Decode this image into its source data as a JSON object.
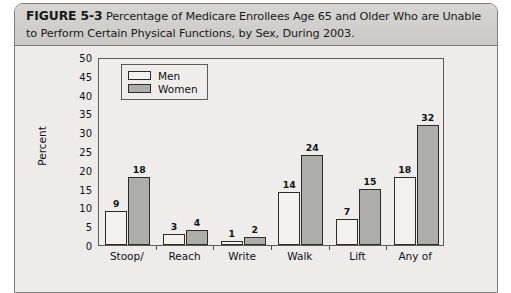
{
  "figure": {
    "number_label": "FIGURE 5-3",
    "caption": "Percentage of Medicare Enrollees Age 65 and Older Who are Unable to Perform Certain Physical Functions, by Sex, During 2003."
  },
  "colors": {
    "men_fill": "#f2f1ef",
    "women_fill": "#adadab",
    "bar_outline": "#2b2b2b",
    "plot_background": "#efedeb",
    "caption_background": "#d3d1ce"
  },
  "legend": {
    "position": "top-left-inside",
    "entries": [
      {
        "label": "Men",
        "swatch": "men"
      },
      {
        "label": "Women",
        "swatch": "women"
      }
    ]
  },
  "chart_data": {
    "type": "bar",
    "title": "Percentage of Medicare Enrollees Age 65 and Older Who are Unable to Perform Certain Physical Functions, by Sex, During 2003.",
    "xlabel": "",
    "ylabel": "Percent",
    "ylim": [
      0,
      50
    ],
    "yticks": [
      0,
      5,
      10,
      15,
      20,
      25,
      30,
      35,
      40,
      45,
      50
    ],
    "ytick_labels": [
      "0",
      "5",
      "10",
      "15",
      "20",
      "25",
      "30",
      "35",
      "40",
      "45",
      "50"
    ],
    "grid": false,
    "legend": [
      "Men",
      "Women"
    ],
    "categories": [
      "Stoop/",
      "Reach",
      "Write",
      "Walk",
      "Lift",
      "Any of"
    ],
    "series": [
      {
        "name": "Men",
        "values": [
          9,
          3,
          1,
          14,
          7,
          18
        ]
      },
      {
        "name": "Women",
        "values": [
          18,
          4,
          2,
          24,
          15,
          32
        ]
      }
    ],
    "data_labels": [
      "9",
      "18",
      "3",
      "4",
      "1",
      "2",
      "14",
      "24",
      "7",
      "15",
      "18",
      "32"
    ]
  }
}
